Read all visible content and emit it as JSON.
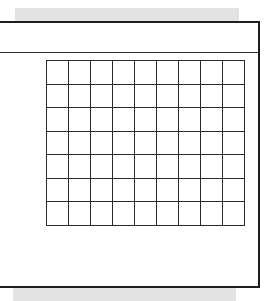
{
  "diagram": {
    "type": "grid",
    "rows": 7,
    "columns": 9,
    "header_text": "",
    "colors": {
      "border": "#1e1e1e",
      "grid_line": "#2a2a2a",
      "shadow_bar": "#e3e3e3",
      "background": "#ffffff"
    }
  }
}
